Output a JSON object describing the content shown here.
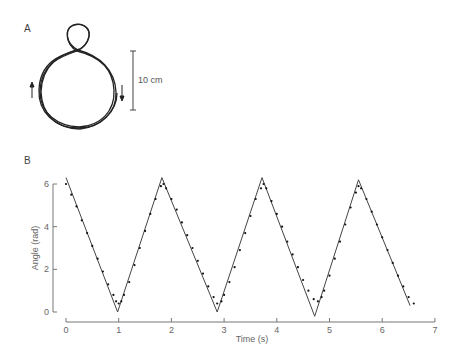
{
  "panel_a": {
    "label": "A",
    "scale_bar_label": "10 cm",
    "description": "Trajectory of a figure-eight–like loop: small loop on top, large circle below, with arrows indicating direction"
  },
  "panel_b": {
    "label": "B"
  },
  "chart_data": {
    "type": "line",
    "title": "",
    "xlabel": "Time (s)",
    "ylabel": "Angle (rad)",
    "xlim": [
      0,
      7
    ],
    "ylim": [
      0,
      6.3
    ],
    "x_ticks": [
      "0",
      "1",
      "2",
      "3",
      "4",
      "5",
      "6",
      "7"
    ],
    "y_ticks": [
      "0",
      "2",
      "4",
      "6"
    ],
    "grid": false,
    "legend": null,
    "series": [
      {
        "name": "model (solid line)",
        "style": "solid",
        "x": [
          0,
          0.98,
          1.82,
          2.87,
          3.72,
          4.72,
          5.55,
          6.53
        ],
        "y": [
          6.3,
          0.0,
          6.3,
          0.0,
          6.3,
          -0.2,
          6.2,
          0.3
        ]
      },
      {
        "name": "measured (dots)",
        "style": "dotted",
        "x": [
          0.0,
          0.1,
          0.2,
          0.3,
          0.4,
          0.5,
          0.6,
          0.7,
          0.8,
          0.9,
          0.95,
          1.0,
          1.05,
          1.1,
          1.2,
          1.3,
          1.4,
          1.5,
          1.6,
          1.7,
          1.8,
          1.85,
          1.9,
          2.0,
          2.1,
          2.2,
          2.3,
          2.4,
          2.5,
          2.6,
          2.7,
          2.8,
          2.87,
          2.95,
          3.0,
          3.1,
          3.2,
          3.3,
          3.4,
          3.5,
          3.6,
          3.7,
          3.75,
          3.8,
          3.9,
          4.0,
          4.1,
          4.2,
          4.3,
          4.4,
          4.5,
          4.6,
          4.7,
          4.78,
          4.85,
          4.9,
          5.0,
          5.1,
          5.2,
          5.3,
          5.4,
          5.5,
          5.55,
          5.6,
          5.7,
          5.8,
          5.9,
          6.0,
          6.1,
          6.2,
          6.3,
          6.4,
          6.5,
          6.6
        ],
        "y": [
          6.0,
          5.5,
          4.95,
          4.3,
          3.7,
          3.1,
          2.5,
          1.9,
          1.3,
          0.8,
          0.5,
          0.4,
          0.5,
          0.8,
          1.4,
          2.2,
          3.0,
          3.8,
          4.6,
          5.3,
          5.9,
          6.0,
          5.8,
          5.3,
          4.8,
          4.2,
          3.6,
          3.0,
          2.4,
          1.8,
          1.2,
          0.7,
          0.4,
          0.5,
          0.8,
          1.4,
          2.1,
          2.9,
          3.7,
          4.5,
          5.3,
          5.8,
          6.0,
          5.8,
          5.2,
          4.6,
          4.0,
          3.3,
          2.7,
          2.1,
          1.5,
          1.0,
          0.6,
          0.5,
          0.7,
          1.0,
          1.7,
          2.5,
          3.3,
          4.1,
          4.9,
          5.6,
          5.9,
          5.8,
          5.3,
          4.7,
          4.1,
          3.5,
          2.9,
          2.3,
          1.7,
          1.2,
          0.7,
          0.4
        ]
      }
    ]
  }
}
